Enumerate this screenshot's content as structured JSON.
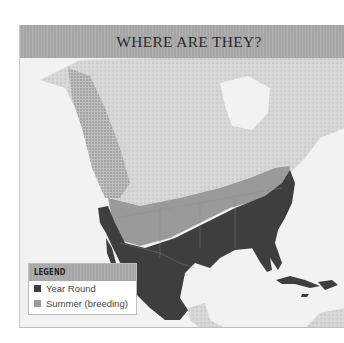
{
  "header": {
    "title": "WHERE ARE THEY?"
  },
  "map": {
    "region": "North and Central America",
    "colors": {
      "background_water": "#f2f2f2",
      "land_light": "#dcdcdc",
      "year_round": "#3e3e3e",
      "summer_breeding": "#9a9a9a",
      "header": "#ababab"
    }
  },
  "legend": {
    "title": "LEGEND",
    "items": [
      {
        "label": "Year Round",
        "color": "#3e3e3e"
      },
      {
        "label": "Summer (breeding)",
        "color": "#9a9a9a"
      }
    ]
  }
}
